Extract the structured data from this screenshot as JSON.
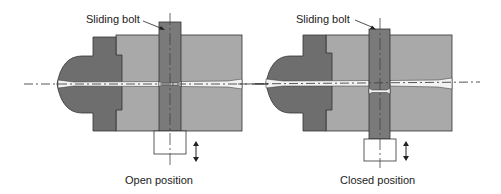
{
  "colors": {
    "dark_block": "#6e6e6e",
    "light_block": "#a9a9a9",
    "bolt": "#7a7a7a",
    "channel": "#f2f2f2",
    "outline": "#333333",
    "background": "#ffffff"
  },
  "diagrams": [
    {
      "id": "open",
      "callout_label": "Sliding bolt",
      "caption": "Open position"
    },
    {
      "id": "closed",
      "callout_label": "Sliding bolt",
      "caption": "Closed position"
    }
  ]
}
